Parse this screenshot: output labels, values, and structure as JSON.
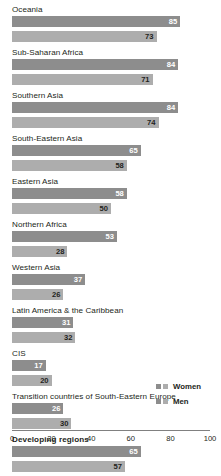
{
  "chart_data": {
    "type": "bar",
    "title": "",
    "subtitle": "",
    "xlabel": "",
    "ylabel": "",
    "orientation": "horizontal",
    "xlim": [
      0,
      100
    ],
    "grid": false,
    "legend_position": "bottom-right",
    "axis_ticks": [
      "0",
      "20",
      "40",
      "60",
      "80",
      "100"
    ],
    "axis_tick_values": [
      0,
      20,
      40,
      60,
      80,
      100
    ],
    "categories": [
      "Oceania",
      "Sub-Saharan Africa",
      "Southern Asia",
      "South-Eastern Asia",
      "Eastern Asia",
      "Northern Africa",
      "Western Asia",
      "Latin America & the Caribbean",
      "CIS",
      "Transition countries of South-Eastern Europe",
      "Developing regions"
    ],
    "emphasized_categories": [
      "Developing regions"
    ],
    "series": [
      {
        "name": "Women",
        "color": "#8d8d8d",
        "values": [
          85,
          84,
          84,
          65,
          58,
          53,
          37,
          31,
          17,
          26,
          65
        ]
      },
      {
        "name": "Men",
        "color": "#adadad",
        "values": [
          73,
          71,
          74,
          58,
          50,
          28,
          26,
          32,
          20,
          30,
          57
        ]
      }
    ]
  },
  "legend": {
    "entries": [
      {
        "label": "Women",
        "swatch_dark": "#8d8d8d",
        "swatch_light": "#adadad"
      },
      {
        "label": "Men",
        "swatch_dark": "#8d8d8d",
        "swatch_light": "#adadad"
      }
    ]
  },
  "colors": {
    "background": "#ffffff",
    "text": "#231f20",
    "axis": "#808080",
    "women_bar": "#8d8d8d",
    "men_bar": "#adadad"
  }
}
